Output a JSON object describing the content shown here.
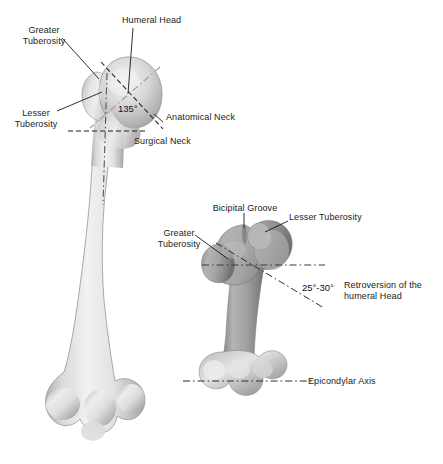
{
  "figure": {
    "background_color": "#ffffff",
    "text_color": "#1a1a1a",
    "leader_line_color": "#1a1a1a",
    "bone_light_color": "#e9e9e9",
    "bone_mid_color": "#9d9d9d",
    "width": 443,
    "height": 464
  },
  "left_view": {
    "name": "anterior-humerus-full-length",
    "labels": {
      "greater_tuberosity": "Greater\nTuberosity",
      "humeral_head": "Humeral Head",
      "lesser_tuberosity": "Lesser\nTuberosity",
      "anatomical_neck": "Anatomical Neck",
      "surgical_neck": "Surgical Neck",
      "neck_shaft_angle": "135°"
    }
  },
  "right_view": {
    "name": "superior-humerus-retroversion",
    "labels": {
      "bicipital_groove": "Bicipital Groove",
      "lesser_tuberosity": "Lesser Tuberosity",
      "greater_tuberosity": "Greater\nTuberosity",
      "retroversion_angle": "25°-30°",
      "retroversion_caption": "Retroversion of the\nhumeral Head",
      "epicondylar_axis": "Epicondylar Axis"
    }
  }
}
